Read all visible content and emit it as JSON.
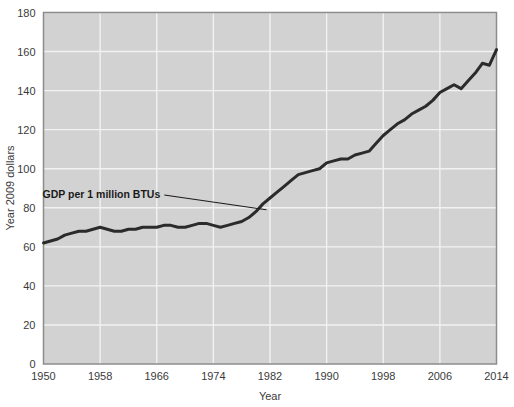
{
  "chart_data": {
    "type": "line",
    "title": "",
    "xlabel": "Year",
    "ylabel": "Year 2009 dollars",
    "xlim": [
      1950,
      2014
    ],
    "ylim": [
      0,
      180
    ],
    "grid": true,
    "legend_position": "none",
    "xticks": [
      1950,
      1958,
      1966,
      1974,
      1982,
      1990,
      1998,
      2006,
      2014
    ],
    "yticks": [
      0,
      20,
      40,
      60,
      80,
      100,
      120,
      140,
      160,
      180
    ],
    "annotations": [
      {
        "text": "GDP per 1 million BTUs",
        "x": 1966.5,
        "y": 85,
        "leader_to_x": 1981.5,
        "leader_to_y": 79
      }
    ],
    "series": [
      {
        "name": "GDP per 1 million BTUs",
        "color": "#2b2b2b",
        "line_width": 3,
        "x": [
          1950,
          1951,
          1952,
          1953,
          1954,
          1955,
          1956,
          1957,
          1958,
          1959,
          1960,
          1961,
          1962,
          1963,
          1964,
          1965,
          1966,
          1967,
          1968,
          1969,
          1970,
          1971,
          1972,
          1973,
          1974,
          1975,
          1976,
          1977,
          1978,
          1979,
          1980,
          1981,
          1982,
          1983,
          1984,
          1985,
          1986,
          1987,
          1988,
          1989,
          1990,
          1991,
          1992,
          1993,
          1994,
          1995,
          1996,
          1997,
          1998,
          1999,
          2000,
          2001,
          2002,
          2003,
          2004,
          2005,
          2006,
          2007,
          2008,
          2009,
          2010,
          2011,
          2012,
          2013,
          2014
        ],
        "values": [
          62,
          63,
          64,
          66,
          67,
          68,
          68,
          69,
          70,
          69,
          68,
          68,
          69,
          69,
          70,
          70,
          70,
          71,
          71,
          70,
          70,
          71,
          72,
          72,
          71,
          70,
          71,
          72,
          73,
          75,
          78,
          82,
          85,
          88,
          91,
          94,
          97,
          98,
          99,
          100,
          103,
          104,
          105,
          105,
          107,
          108,
          109,
          113,
          117,
          120,
          123,
          125,
          128,
          130,
          132,
          135,
          139,
          141,
          143,
          141,
          145,
          149,
          154,
          153,
          161
        ]
      }
    ]
  },
  "axes": {
    "ylabel_text": "Year 2009 dollars",
    "xlabel_text": "Year"
  },
  "styling": {
    "plot_background": "#d2d2d2",
    "grid_color": "#f2f2f2",
    "frame_color": "#8c8c8c",
    "line_color": "#2b2b2b",
    "page_background": "#ffffff",
    "text_color": "#3b3b3b"
  }
}
